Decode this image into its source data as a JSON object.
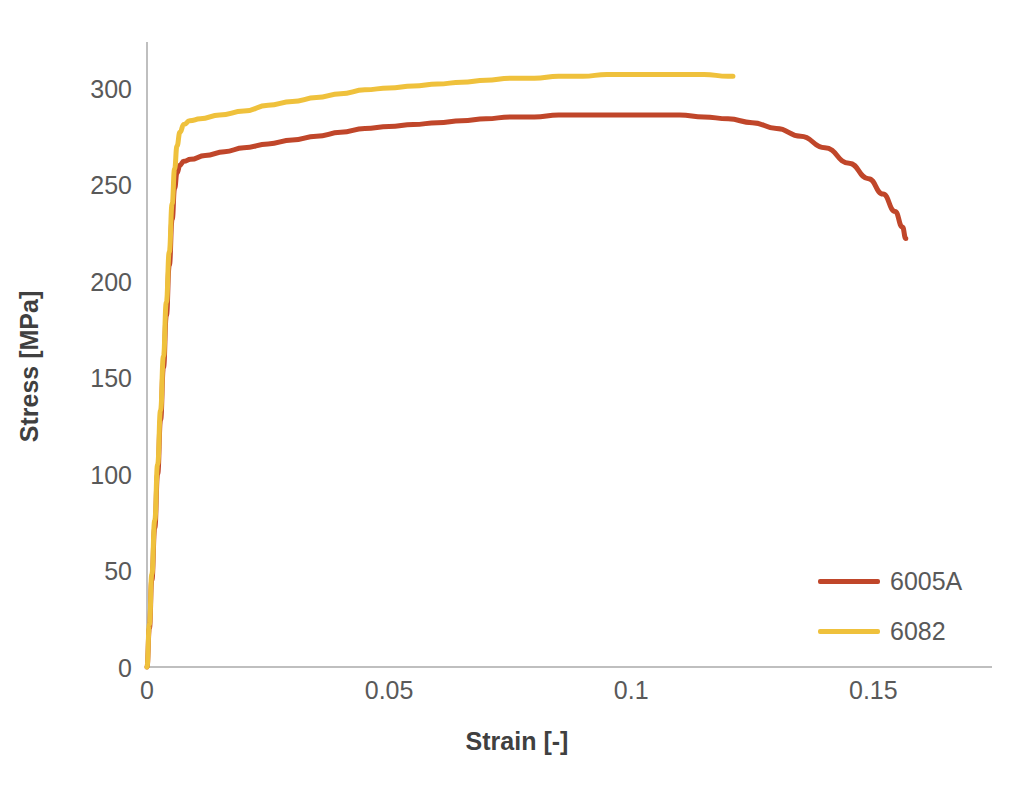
{
  "chart_data": {
    "type": "line",
    "title": "",
    "xlabel": "Strain [-]",
    "ylabel": "Stress [MPa]",
    "xlim": [
      0,
      0.1745
    ],
    "ylim": [
      0,
      323.8
    ],
    "grid": false,
    "legend_position": "inside-bottom-right",
    "x_ticks": [
      "0",
      "0.05",
      "0.1",
      "0.15"
    ],
    "x_tick_values": [
      0,
      0.05,
      0.1,
      0.15
    ],
    "y_ticks": [
      "0",
      "50",
      "100",
      "150",
      "200",
      "250",
      "300"
    ],
    "y_tick_values": [
      0,
      50,
      100,
      150,
      200,
      250,
      300
    ],
    "series": [
      {
        "name": "6005A",
        "color": "#C0462A",
        "points": [
          [
            0.0,
            0
          ],
          [
            0.0005,
            20
          ],
          [
            0.001,
            45
          ],
          [
            0.0016,
            72
          ],
          [
            0.0022,
            100
          ],
          [
            0.0028,
            128
          ],
          [
            0.0034,
            155
          ],
          [
            0.004,
            182
          ],
          [
            0.0046,
            208
          ],
          [
            0.0052,
            232
          ],
          [
            0.0057,
            248
          ],
          [
            0.0062,
            256
          ],
          [
            0.0068,
            260
          ],
          [
            0.0076,
            262
          ],
          [
            0.009,
            263
          ],
          [
            0.012,
            265
          ],
          [
            0.016,
            267
          ],
          [
            0.02,
            269
          ],
          [
            0.025,
            271
          ],
          [
            0.03,
            273
          ],
          [
            0.035,
            275
          ],
          [
            0.04,
            277
          ],
          [
            0.045,
            279
          ],
          [
            0.05,
            280
          ],
          [
            0.055,
            281
          ],
          [
            0.06,
            282
          ],
          [
            0.065,
            283
          ],
          [
            0.07,
            284
          ],
          [
            0.075,
            285
          ],
          [
            0.08,
            285
          ],
          [
            0.085,
            286
          ],
          [
            0.09,
            286
          ],
          [
            0.095,
            286
          ],
          [
            0.1,
            286
          ],
          [
            0.105,
            286
          ],
          [
            0.11,
            286
          ],
          [
            0.115,
            285
          ],
          [
            0.12,
            284
          ],
          [
            0.125,
            282
          ],
          [
            0.13,
            279
          ],
          [
            0.135,
            275
          ],
          [
            0.14,
            269
          ],
          [
            0.145,
            261
          ],
          [
            0.149,
            253
          ],
          [
            0.152,
            245
          ],
          [
            0.1545,
            236
          ],
          [
            0.156,
            228
          ],
          [
            0.1567,
            222
          ]
        ]
      },
      {
        "name": "6082",
        "color": "#EFC13C",
        "points": [
          [
            0.0,
            0
          ],
          [
            0.0005,
            22
          ],
          [
            0.001,
            48
          ],
          [
            0.0016,
            76
          ],
          [
            0.0022,
            105
          ],
          [
            0.0028,
            133
          ],
          [
            0.0034,
            161
          ],
          [
            0.004,
            189
          ],
          [
            0.0046,
            215
          ],
          [
            0.0052,
            240
          ],
          [
            0.0057,
            258
          ],
          [
            0.0062,
            270
          ],
          [
            0.0068,
            277
          ],
          [
            0.0076,
            281
          ],
          [
            0.0088,
            283
          ],
          [
            0.011,
            284
          ],
          [
            0.015,
            286
          ],
          [
            0.02,
            288
          ],
          [
            0.025,
            291
          ],
          [
            0.03,
            293
          ],
          [
            0.035,
            295
          ],
          [
            0.04,
            297
          ],
          [
            0.045,
            299
          ],
          [
            0.05,
            300
          ],
          [
            0.055,
            301
          ],
          [
            0.06,
            302
          ],
          [
            0.065,
            303
          ],
          [
            0.07,
            304
          ],
          [
            0.075,
            305
          ],
          [
            0.08,
            305
          ],
          [
            0.085,
            306
          ],
          [
            0.09,
            306
          ],
          [
            0.095,
            307
          ],
          [
            0.1,
            307
          ],
          [
            0.105,
            307
          ],
          [
            0.11,
            307
          ],
          [
            0.115,
            307
          ],
          [
            0.12,
            306
          ],
          [
            0.121,
            306
          ]
        ]
      }
    ]
  },
  "axes": {
    "x_title": "Strain [-]",
    "y_title": "Stress [MPa]"
  },
  "legend": {
    "items": [
      {
        "label": "6005A",
        "color": "#C0462A"
      },
      {
        "label": "6082",
        "color": "#EFC13C"
      }
    ]
  },
  "colors": {
    "series_6005a": "#C0462A",
    "series_6082": "#EFC13C",
    "axis_line": "#BFBFBF",
    "tick_text": "#595959",
    "title_text": "#404040",
    "background": "#FFFFFF"
  }
}
